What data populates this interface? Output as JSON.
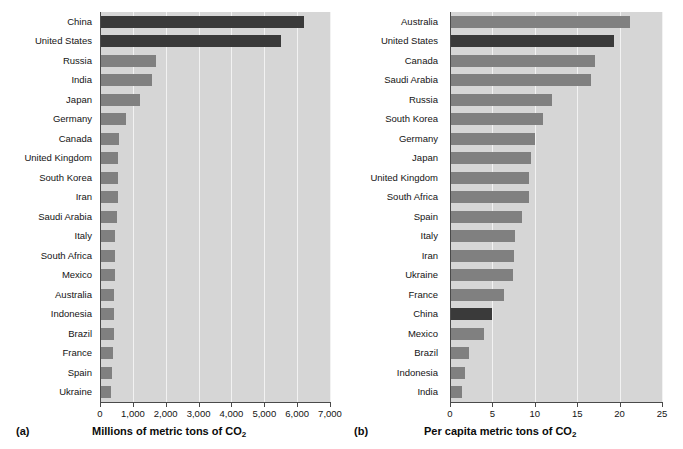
{
  "figure": {
    "background": "#ffffff",
    "bar_color": "#808080",
    "highlight_color": "#3a3a3a",
    "plot_background": "#d6d6d6"
  },
  "panel_a": {
    "tag": "(a)",
    "axis_title_main": "Millions of metric tons of CO",
    "axis_title_sub": "2",
    "tick_labels": [
      "0",
      "1,000",
      "2,000",
      "3,000",
      "4,000",
      "5,000",
      "6,000",
      "7,000"
    ]
  },
  "panel_b": {
    "tag": "(b)",
    "axis_title_main": "Per capita metric tons of CO",
    "axis_title_sub": "2",
    "tick_labels": [
      "0",
      "5",
      "10",
      "15",
      "20",
      "25"
    ]
  },
  "chart_data": [
    {
      "type": "bar",
      "orientation": "horizontal",
      "title": "",
      "xlabel": "Millions of metric tons of CO2",
      "ylabel": "",
      "xlim": [
        0,
        7000
      ],
      "xticks": [
        0,
        1000,
        2000,
        3000,
        4000,
        5000,
        6000,
        7000
      ],
      "grid": true,
      "legend": "none",
      "panel": "(a)",
      "categories": [
        "China",
        "United States",
        "Russia",
        "India",
        "Japan",
        "Germany",
        "Canada",
        "United Kingdom",
        "South Korea",
        "Iran",
        "Saudi Arabia",
        "Italy",
        "South Africa",
        "Mexico",
        "Australia",
        "Indonesia",
        "Brazil",
        "France",
        "Spain",
        "Ukraine"
      ],
      "values": [
        6200,
        5500,
        1700,
        1580,
        1220,
        800,
        570,
        550,
        540,
        540,
        530,
        460,
        450,
        450,
        440,
        430,
        430,
        400,
        350,
        330
      ],
      "highlighted": [
        "China",
        "United States"
      ]
    },
    {
      "type": "bar",
      "orientation": "horizontal",
      "title": "",
      "xlabel": "Per capita metric tons of CO2",
      "ylabel": "",
      "xlim": [
        0,
        25
      ],
      "xticks": [
        0,
        5,
        10,
        15,
        20,
        25
      ],
      "grid": true,
      "legend": "none",
      "panel": "(b)",
      "categories": [
        "Australia",
        "United States",
        "Canada",
        "Saudi Arabia",
        "Russia",
        "South Korea",
        "Germany",
        "Japan",
        "United Kingdom",
        "South Africa",
        "Spain",
        "Italy",
        "Iran",
        "Ukraine",
        "France",
        "China",
        "Mexico",
        "Brazil",
        "Indonesia",
        "India"
      ],
      "values": [
        21.2,
        19.3,
        17.1,
        16.6,
        12.0,
        11.0,
        10.0,
        9.5,
        9.3,
        9.3,
        8.5,
        7.7,
        7.6,
        7.4,
        6.4,
        4.9,
        4.0,
        2.2,
        1.8,
        1.4
      ],
      "highlighted": [
        "United States",
        "China"
      ]
    }
  ]
}
